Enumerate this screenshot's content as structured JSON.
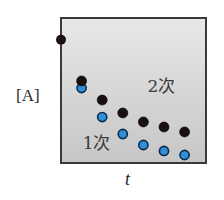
{
  "chart_data": {
    "type": "scatter",
    "title": "",
    "xlabel": "t",
    "ylabel": "[A]",
    "xlim": [
      0,
      7.04
    ],
    "ylim": [
      0,
      10
    ],
    "grid": false,
    "legend": "inline annotations",
    "initial_point": {
      "x": 0,
      "y": 8.5,
      "color": "#1a1010"
    },
    "series": [
      {
        "name": "2次",
        "label_en": "second-order",
        "color": "#1a1010",
        "edge_color": "#000000",
        "x": [
          1,
          2,
          3,
          4,
          5,
          6
        ],
        "values": [
          5.66,
          4.34,
          3.45,
          2.83,
          2.48,
          2.14
        ],
        "annotation": {
          "text": "2次",
          "x": 4.2,
          "y": 4.9
        }
      },
      {
        "name": "1次",
        "label_en": "first-order",
        "color": "#2f8fd8",
        "edge_color": "#0d2a4a",
        "x": [
          1,
          2,
          3,
          4,
          5,
          6
        ],
        "values": [
          5.17,
          3.17,
          2.0,
          1.24,
          0.83,
          0.55
        ],
        "annotation": {
          "text": "1次",
          "x": 1.05,
          "y": 1.0
        }
      }
    ],
    "plot_background": {
      "top": "#e8e8e8",
      "bottom": "#c6c6c6"
    },
    "frame_color": "#3a3a3a"
  }
}
